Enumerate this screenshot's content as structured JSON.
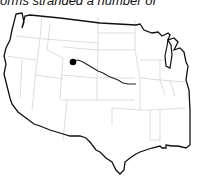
{
  "caption": "orms stranded a number of",
  "map": {
    "region": "continental-united-states",
    "marker": {
      "label": "origin-point",
      "state": "Wyoming",
      "x": 76,
      "y": 61
    },
    "route": {
      "description": "path from Wyoming east across Nebraska to Kansas City area"
    },
    "colors": {
      "outline": "#111111",
      "state_borders": "#cccccc",
      "route": "#222222",
      "background": "#ffffff"
    }
  }
}
